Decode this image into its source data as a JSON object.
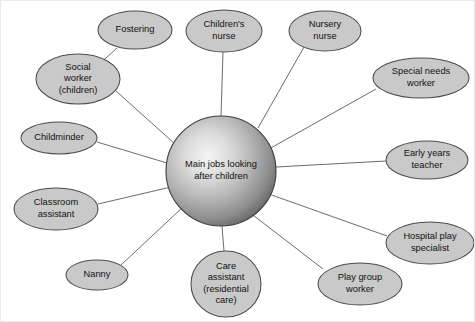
{
  "diagram": {
    "type": "mind-map",
    "center": {
      "id": "center",
      "label_lines": [
        "Main jobs looking",
        "after children"
      ],
      "cx": 220,
      "cy": 170,
      "r": 55,
      "fill_light": "#f2f2f2",
      "fill_dark": "#5f5f5f"
    },
    "style": {
      "node_fill": "#c9c9c9",
      "node_stroke": "#4c4c4c",
      "spoke_stroke": "#5a5a5a",
      "text_color": "#111111",
      "background": "#ffffff",
      "frame_stroke": "#e9e9e9"
    },
    "nodes": [
      {
        "id": "fostering",
        "label_lines": [
          "Fostering"
        ],
        "cx": 134,
        "cy": 29,
        "rx": 37,
        "ry": 19,
        "parent": "social-worker-children",
        "link_from": [
          116,
          47
        ],
        "link_to": [
          94,
          67
        ]
      },
      {
        "id": "childrens-nurse",
        "label_lines": [
          "Children's",
          "nurse"
        ],
        "cx": 223,
        "cy": 30,
        "rx": 38,
        "ry": 21,
        "parent": "center",
        "link_from": [
          222,
          51
        ],
        "link_to": [
          220,
          115
        ]
      },
      {
        "id": "nursery-nurse",
        "label_lines": [
          "Nursery",
          "nurse"
        ],
        "cx": 324,
        "cy": 30,
        "rx": 36,
        "ry": 20,
        "parent": "center",
        "link_from": [
          303,
          46
        ],
        "link_to": [
          257,
          127
        ]
      },
      {
        "id": "social-worker-children",
        "label_lines": [
          "Social",
          "worker",
          "(children)"
        ],
        "cx": 77,
        "cy": 78,
        "rx": 42,
        "ry": 25,
        "parent": "center",
        "link_from": [
          115,
          90
        ],
        "link_to": [
          174,
          143
        ]
      },
      {
        "id": "special-needs-worker",
        "label_lines": [
          "Special needs",
          "worker"
        ],
        "cx": 420,
        "cy": 77,
        "rx": 48,
        "ry": 20,
        "parent": "center",
        "link_from": [
          375,
          88
        ],
        "link_to": [
          268,
          148
        ]
      },
      {
        "id": "childminder",
        "label_lines": [
          "Childminder"
        ],
        "cx": 58,
        "cy": 137,
        "rx": 38,
        "ry": 16,
        "parent": "center",
        "link_from": [
          96,
          141
        ],
        "link_to": [
          166,
          162
        ]
      },
      {
        "id": "early-years-teacher",
        "label_lines": [
          "Early years",
          "teacher"
        ],
        "cx": 426,
        "cy": 159,
        "rx": 41,
        "ry": 19,
        "parent": "center",
        "link_from": [
          385,
          160
        ],
        "link_to": [
          275,
          166
        ]
      },
      {
        "id": "classroom-assistant",
        "label_lines": [
          "Classroom",
          "assistant"
        ],
        "cx": 55,
        "cy": 208,
        "rx": 42,
        "ry": 21,
        "parent": "center",
        "link_from": [
          97,
          203
        ],
        "link_to": [
          170,
          186
        ]
      },
      {
        "id": "hospital-play-specialist",
        "label_lines": [
          "Hospital play",
          "specialist"
        ],
        "cx": 429,
        "cy": 242,
        "rx": 44,
        "ry": 21,
        "parent": "center",
        "link_from": [
          386,
          235
        ],
        "link_to": [
          265,
          192
        ]
      },
      {
        "id": "nanny",
        "label_lines": [
          "Nanny"
        ],
        "cx": 96,
        "cy": 274,
        "rx": 31,
        "ry": 15,
        "parent": "center",
        "link_from": [
          120,
          264
        ],
        "link_to": [
          182,
          206
        ]
      },
      {
        "id": "care-assistant-residential",
        "label_lines": [
          "Care",
          "assistant",
          "(residential",
          "care)"
        ],
        "cx": 225,
        "cy": 283,
        "rx": 35,
        "ry": 33,
        "parent": "center",
        "link_from": [
          223,
          250
        ],
        "link_to": [
          221,
          225
        ]
      },
      {
        "id": "play-group-worker",
        "label_lines": [
          "Play group",
          "worker"
        ],
        "cx": 359,
        "cy": 283,
        "rx": 42,
        "ry": 21,
        "parent": "center",
        "link_from": [
          322,
          268
        ],
        "link_to": [
          248,
          211
        ]
      }
    ]
  }
}
